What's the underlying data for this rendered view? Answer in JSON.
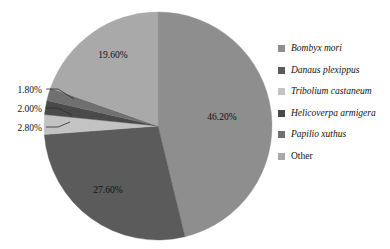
{
  "chart_data": {
    "type": "pie",
    "title": "",
    "subtitle": "",
    "legend_position": "right",
    "grid": false,
    "start_angle_deg": 0,
    "direction": "clockwise",
    "categories": [
      "Bombyx mori",
      "Danaus plexippus",
      "Tribolium castaneum",
      "Helicoverpa armigera",
      "Papilio xuthus",
      "Other"
    ],
    "values": [
      46.2,
      27.6,
      2.8,
      2.0,
      1.8,
      19.6
    ],
    "value_unit": "%",
    "colors": [
      "#8e8e8e",
      "#5b5b5b",
      "#c3c3c3",
      "#4a4a4a",
      "#707070",
      "#a9a9a9"
    ],
    "slices": [
      {
        "label": "Bombyx mori",
        "value": 46.2,
        "display": "46.20%",
        "color": "#8e8e8e",
        "italic": true,
        "label_placement": "inside"
      },
      {
        "label": "Danaus plexippus",
        "value": 27.6,
        "display": "27.60%",
        "color": "#5b5b5b",
        "italic": true,
        "label_placement": "inside"
      },
      {
        "label": "Tribolium castaneum",
        "value": 2.8,
        "display": "2.80%",
        "color": "#c3c3c3",
        "italic": true,
        "label_placement": "callout"
      },
      {
        "label": "Helicoverpa armigera",
        "value": 2.0,
        "display": "2.00%",
        "color": "#4a4a4a",
        "italic": true,
        "label_placement": "callout"
      },
      {
        "label": "Papilio xuthus",
        "value": 1.8,
        "display": "1.80%",
        "color": "#707070",
        "italic": true,
        "label_placement": "callout"
      },
      {
        "label": "Other",
        "value": 19.6,
        "display": "19.60%",
        "color": "#a9a9a9",
        "italic": false,
        "label_placement": "inside"
      }
    ]
  },
  "labels": {
    "slice_46": "46.20%",
    "slice_27": "27.60%",
    "slice_19": "19.60%",
    "callout_280": "2.80%",
    "callout_200": "2.00%",
    "callout_180": "1.80%"
  },
  "legend": {
    "items": [
      {
        "label": "Bombyx mori",
        "color": "#8e8e8e",
        "italic": true
      },
      {
        "label": "Danaus plexippus",
        "color": "#5b5b5b",
        "italic": true
      },
      {
        "label": "Tribolium castaneum",
        "color": "#c3c3c3",
        "italic": true
      },
      {
        "label": "Helicoverpa armigera",
        "color": "#4a4a4a",
        "italic": true
      },
      {
        "label": "Papilio xuthus",
        "color": "#707070",
        "italic": true
      },
      {
        "label": "Other",
        "color": "#a9a9a9",
        "italic": false
      }
    ]
  },
  "geometry": {
    "center_x": 158,
    "center_y": 126,
    "radius": 114
  }
}
